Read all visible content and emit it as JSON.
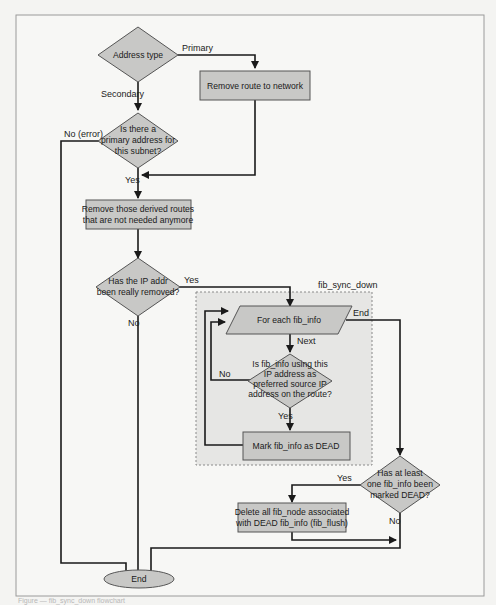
{
  "diagram": {
    "title": "fib_sync_down",
    "nodes": {
      "address_type": "Address type",
      "remove_route": "Remove route to network",
      "primary_check": [
        "Is there a",
        "primary address for",
        "this subnet?"
      ],
      "remove_derived": [
        "Remove those derived routes",
        "that are not needed anymore"
      ],
      "ip_removed": [
        "Has the IP addr",
        "been really removed?"
      ],
      "for_each": "For each fib_info",
      "using_ip": [
        "Is fib_info using this",
        "IP address as",
        "preferred source IP",
        "address on the route?"
      ],
      "mark_dead": "Mark fib_info as DEAD",
      "any_dead": [
        "Has at least",
        "one fib_info been",
        "marked DEAD?"
      ],
      "delete_nodes": [
        "Delete all fib_node associated",
        "with DEAD fib_info (fib_flush)"
      ],
      "end": "End"
    },
    "edge_labels": {
      "primary": "Primary",
      "secondary": "Secondary",
      "no_error": "No (error)",
      "yes1": "Yes",
      "yes2": "Yes",
      "no2": "No",
      "end_loop": "End",
      "next": "Next",
      "no3": "No",
      "yes3": "Yes",
      "yes4": "Yes",
      "no4": "No"
    },
    "group_label": "fib_sync_down"
  },
  "caption": "Figure — fib_sync_down flowchart"
}
